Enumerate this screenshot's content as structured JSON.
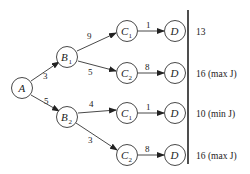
{
  "diagram": {
    "nodes": {
      "A": {
        "label": "A",
        "sub": ""
      },
      "B1": {
        "label": "B",
        "sub": "1"
      },
      "B2": {
        "label": "B",
        "sub": "2"
      },
      "C1a": {
        "label": "C",
        "sub": "1"
      },
      "C2a": {
        "label": "C",
        "sub": "2"
      },
      "C1b": {
        "label": "C",
        "sub": "1"
      },
      "C2b": {
        "label": "C",
        "sub": "2"
      },
      "Da": {
        "label": "D"
      },
      "Db": {
        "label": "D"
      },
      "Dc": {
        "label": "D"
      },
      "Dd": {
        "label": "D"
      }
    },
    "edges": {
      "A_B1": "3",
      "A_B2": "5",
      "B1_C1": "9",
      "B1_C2": "5",
      "B2_C1": "4",
      "B2_C2": "3",
      "C1a_Da": "1",
      "C2a_Db": "8",
      "C1b_Dc": "1",
      "C2b_Dd": "8"
    },
    "results": [
      {
        "value": "13",
        "note": ""
      },
      {
        "value": "16",
        "note": " (max J)"
      },
      {
        "value": "10",
        "note": " (min J)"
      },
      {
        "value": "16",
        "note": " (max J)"
      }
    ]
  }
}
